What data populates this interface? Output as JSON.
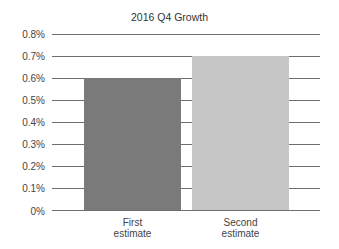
{
  "chart_data": {
    "type": "bar",
    "title": "2016 Q4 Growth",
    "categories": [
      "First estimate",
      "Second estimate"
    ],
    "category_lines": [
      [
        "First",
        "estimate"
      ],
      [
        "Second",
        "estimate"
      ]
    ],
    "values": [
      0.6,
      0.7
    ],
    "value_unit": "%",
    "xlabel": "",
    "ylabel": "",
    "ylim": [
      0,
      0.8
    ],
    "yticks": [
      "0%",
      "0.1%",
      "0.2%",
      "0.3%",
      "0.4%",
      "0.5%",
      "0.6%",
      "0.7%",
      "0.8%"
    ],
    "grid": true,
    "legend": null,
    "colors": [
      "#7a7a7a",
      "#c6c6c6"
    ]
  }
}
